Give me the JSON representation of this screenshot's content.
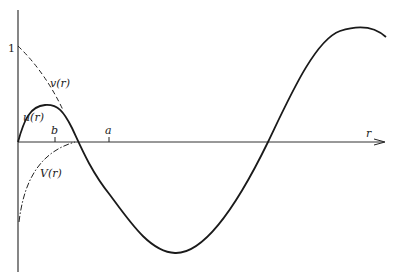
{
  "diagram": {
    "axes": {
      "x_label": "r",
      "y_tick_label": "1"
    },
    "ticks": [
      {
        "label": "b"
      },
      {
        "label": "a"
      }
    ],
    "curves": [
      {
        "name": "u(r)",
        "label": "u(r)",
        "style": "solid"
      },
      {
        "name": "v(r)",
        "label": "v(r)",
        "style": "dashed"
      },
      {
        "name": "V(r)",
        "label": "V(r)",
        "style": "dash-dot"
      }
    ],
    "colors": {
      "ink": "#222222",
      "background": "#ffffff"
    }
  }
}
